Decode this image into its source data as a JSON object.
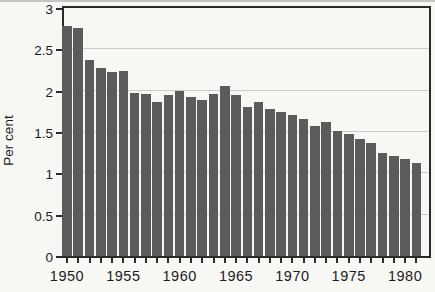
{
  "figure": {
    "ylabel": "Per cent",
    "colors": {
      "background": "#f7f7f4",
      "bar": "#5b5b5b",
      "grid": "#cbcbcb",
      "axis": "#2a2a2a",
      "text": "#1c1c1c",
      "scan_edge": "#ababab"
    }
  },
  "chart_data": {
    "type": "bar",
    "title": "",
    "xlabel": "",
    "ylabel": "Per cent",
    "x": [
      1950,
      1951,
      1952,
      1953,
      1954,
      1955,
      1956,
      1957,
      1958,
      1959,
      1960,
      1961,
      1962,
      1963,
      1964,
      1965,
      1966,
      1967,
      1968,
      1969,
      1970,
      1971,
      1972,
      1973,
      1974,
      1975,
      1976,
      1977,
      1978,
      1979,
      1980,
      1981
    ],
    "values": [
      2.78,
      2.76,
      2.37,
      2.27,
      2.22,
      2.24,
      1.97,
      1.96,
      1.86,
      1.95,
      2.0,
      1.92,
      1.89,
      1.96,
      2.06,
      1.95,
      1.8,
      1.86,
      1.78,
      1.74,
      1.7,
      1.66,
      1.57,
      1.62,
      1.51,
      1.47,
      1.41,
      1.37,
      1.25,
      1.21,
      1.17,
      1.13
    ],
    "ylim": [
      0,
      3
    ],
    "yticks": [
      0,
      0.5,
      1,
      1.5,
      2,
      2.5,
      3
    ],
    "ytick_labels": [
      "0",
      "0.5",
      "1",
      "1.5",
      "2",
      "2.5",
      "3"
    ],
    "xtick_label_years": [
      1950,
      1955,
      1960,
      1965,
      1970,
      1975,
      1980
    ],
    "grid": "horizontal-light",
    "legend": "none",
    "bar_outline": "none"
  }
}
